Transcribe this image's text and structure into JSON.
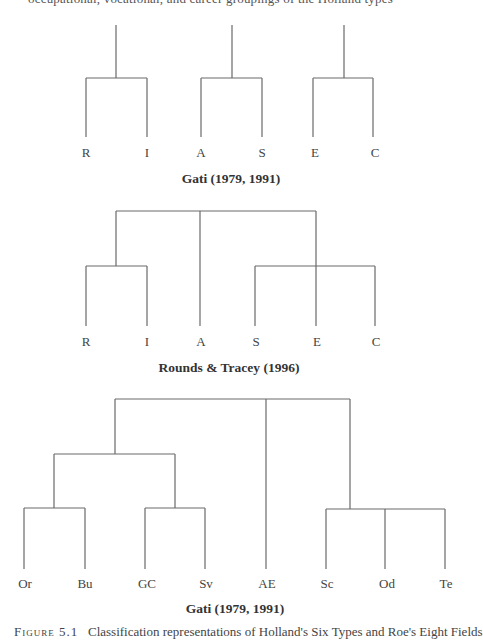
{
  "page": {
    "top_cut_text": "occupational, vocational, and career groupings of the Holland types",
    "bottom_caption_label": "Figure 5.1",
    "bottom_caption_text": "Classification representations of Holland's Six Types and Roe's Eight Fields"
  },
  "dendrograms": [
    {
      "caption": "Gati (1979, 1991)",
      "leaves": [
        "R",
        "I",
        "A",
        "S",
        "E",
        "C"
      ],
      "structure": "((R,I),(A,S),(E,C))"
    },
    {
      "caption": "Rounds & Tracey (1996)",
      "leaves": [
        "R",
        "I",
        "A",
        "S",
        "E",
        "C"
      ],
      "structure": "((R,I),A,(S,E,C))"
    },
    {
      "caption": "Gati (1979, 1991)",
      "leaves": [
        "Or",
        "Bu",
        "GC",
        "Sv",
        "AE",
        "Sc",
        "Od",
        "Te"
      ],
      "structure": "(((Or,Bu),(GC,Sv)),AE,(Sc,Od,Te))"
    }
  ],
  "colors": {
    "line": "#6a6a6a",
    "text": "#333333",
    "background": "#ffffff"
  }
}
